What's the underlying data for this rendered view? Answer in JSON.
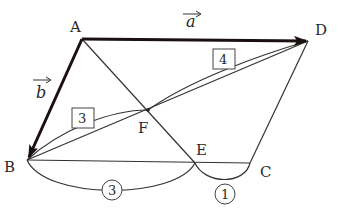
{
  "diagram": {
    "type": "parallelogram-vector-figure",
    "points": {
      "A": {
        "label": "A",
        "x": 82,
        "y": 39
      },
      "B": {
        "label": "B",
        "x": 27,
        "y": 160
      },
      "C": {
        "label": "C",
        "x": 250,
        "y": 163
      },
      "D": {
        "label": "D",
        "x": 308,
        "y": 41
      },
      "E": {
        "label": "E",
        "x": 195,
        "y": 163
      },
      "F": {
        "label": "F",
        "x": 148,
        "y": 110
      }
    },
    "vectors": {
      "a": {
        "label": "a",
        "from": "A",
        "to": "D"
      },
      "b": {
        "label": "b",
        "from": "A",
        "to": "B"
      }
    },
    "segments": [
      "A-D",
      "A-B",
      "B-C",
      "C-D",
      "A-E",
      "B-D"
    ],
    "ratios": {
      "BF": {
        "value": "3",
        "style": "boxed"
      },
      "FD": {
        "value": "4",
        "style": "boxed"
      },
      "BE": {
        "value": "3",
        "style": "circled"
      },
      "EC": {
        "value": "1",
        "style": "circled"
      }
    },
    "colors": {
      "line": "#333333",
      "vector": "#1a1010",
      "background": "#ffffff"
    }
  }
}
